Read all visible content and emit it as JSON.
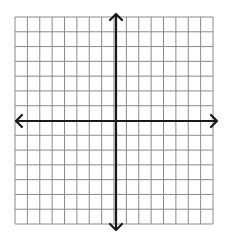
{
  "diagram": {
    "type": "coordinate-plane",
    "grid": {
      "columns": 16,
      "rows": 14,
      "left": 15,
      "top": 17,
      "right": 213,
      "bottom": 224,
      "line_color": "#8a8a8a",
      "line_width": 1
    },
    "axes": {
      "x_axis": {
        "y": 121,
        "from_x": 16,
        "to_x": 217,
        "arrows": [
          "left",
          "right"
        ]
      },
      "y_axis": {
        "x": 116,
        "from_y": 14,
        "to_y": 230,
        "arrows": [
          "up",
          "down"
        ]
      },
      "color": "#1a1a1a",
      "width": 2.2
    },
    "background": "#ffffff"
  }
}
